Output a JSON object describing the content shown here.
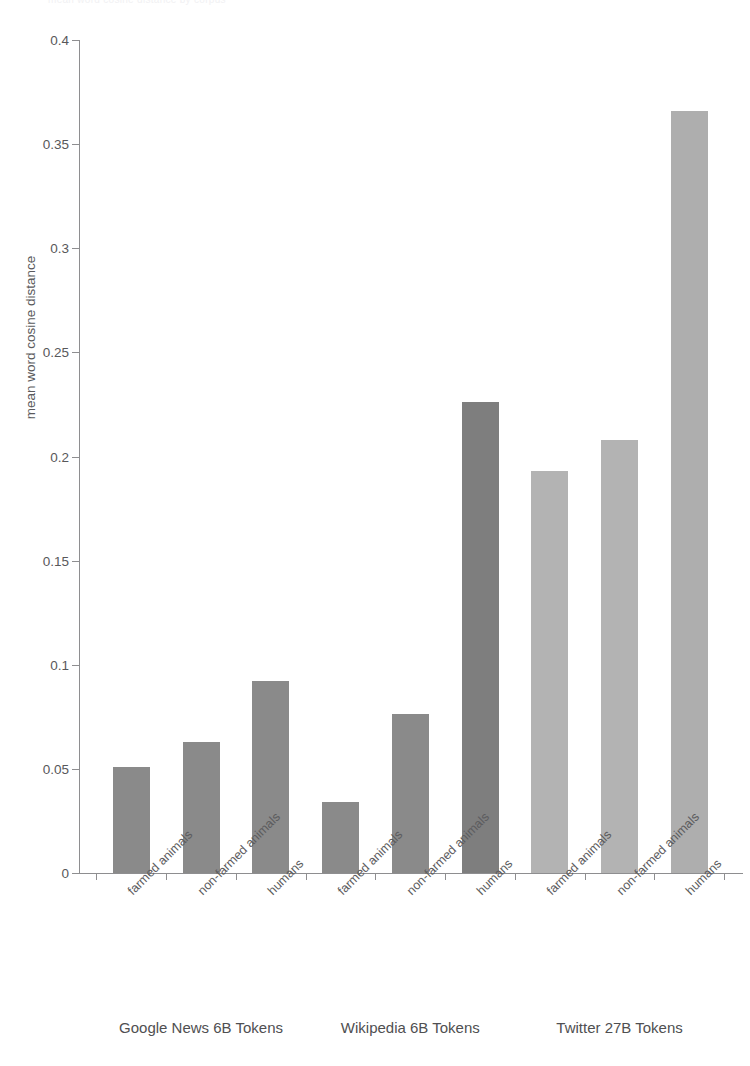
{
  "clipped_header": "mean word cosine distance by corpus",
  "chart_data": {
    "type": "bar",
    "title": "",
    "subtitle": "",
    "xlabel": "",
    "ylabel": "mean word cosine distance",
    "ylim": [
      0,
      0.4
    ],
    "yticks": [
      0,
      0.05,
      0.1,
      0.15,
      0.2,
      0.25,
      0.3,
      0.35,
      0.4
    ],
    "ytick_labels": [
      "0",
      "0.05",
      "0.1",
      "0.15",
      "0.2",
      "0.25",
      "0.3",
      "0.35",
      "0.4"
    ],
    "grid": false,
    "legend_position": "none",
    "categories": [
      "farmed animals",
      "non-farmed animals",
      "humans",
      "farmed animals",
      "non-farmed animals",
      "humans",
      "farmed animals",
      "non-farmed animals",
      "humans"
    ],
    "values": [
      0.051,
      0.063,
      0.092,
      0.034,
      0.0765,
      0.226,
      0.193,
      0.208,
      0.366
    ],
    "bar_colors": [
      "#8a8a8a",
      "#8a8a8a",
      "#8a8a8a",
      "#8a8a8a",
      "#8a8a8a",
      "#7e7e7e",
      "#b3b3b3",
      "#b3b3b3",
      "#aeaeae"
    ],
    "groups": [
      {
        "label": "Google News 6B Tokens",
        "bars": [
          0,
          1,
          2
        ]
      },
      {
        "label": "Wikipedia 6B Tokens",
        "bars": [
          3,
          4,
          5
        ]
      },
      {
        "label": "Twitter 27B Tokens",
        "bars": [
          6,
          7,
          8
        ]
      }
    ],
    "colors": {
      "axis": "#8e8e90",
      "text": "#58585a",
      "series_dark": "#8a8a8a",
      "series_light": "#b3b3b3",
      "background": "#ffffff"
    }
  }
}
